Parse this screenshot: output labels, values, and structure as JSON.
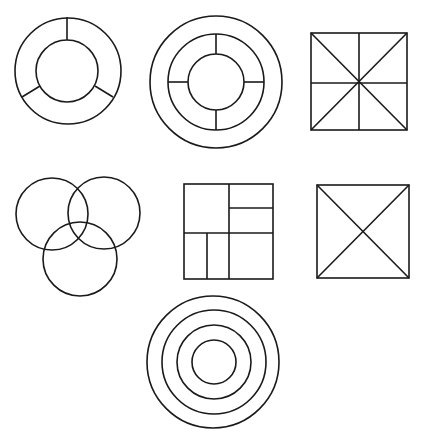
{
  "figure": {
    "stroke_color": "#1a1a1a",
    "background": "#ffffff",
    "shapes": [
      {
        "id": "ring-three-segments",
        "type": "ring",
        "rings": 2,
        "radial_dividers": 3
      },
      {
        "id": "triple-ring-four-segments",
        "type": "ring",
        "rings": 3,
        "radial_dividers": 4
      },
      {
        "id": "square-eight-sections",
        "type": "square",
        "lines": [
          "vertical-mid",
          "horizontal-mid",
          "diagonal",
          "anti-diagonal"
        ]
      },
      {
        "id": "three-circle-venn",
        "type": "venn",
        "circles": 3
      },
      {
        "id": "square-subdivided-grid",
        "type": "square",
        "subdivisions": 6
      },
      {
        "id": "square-with-x",
        "type": "square",
        "lines": [
          "diagonal",
          "anti-diagonal"
        ]
      },
      {
        "id": "concentric-circles",
        "type": "concentric",
        "circles": 4
      }
    ]
  }
}
